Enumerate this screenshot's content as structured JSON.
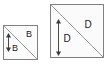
{
  "figure": {
    "background_color": "#ffffff",
    "shapes": [
      {
        "id": "small-square",
        "name": "small-square",
        "side_label": "B",
        "x": 3,
        "y": 25,
        "size": 34,
        "fill": "#fbfbfb",
        "stroke": "#808080",
        "diagonal": "top-left-to-bottom-right",
        "diagonal_color": "#9a9a9a",
        "arrow": {
          "name": "vertical-dimension-arrow-small",
          "orientation": "vertical",
          "double_headed": true,
          "x": 8,
          "y_top": 34,
          "y_bottom": 51,
          "color": "#3a3a3a"
        },
        "labels": [
          {
            "text": "B",
            "x": 29,
            "y": 37,
            "size": "small",
            "position": "upper-right"
          },
          {
            "text": "B",
            "x": 15,
            "y": 51,
            "size": "small",
            "position": "lower-left"
          }
        ]
      },
      {
        "id": "large-square",
        "name": "large-square",
        "side_label": "D",
        "x": 50,
        "y": 4,
        "size": 53,
        "fill": "#fbfbfb",
        "stroke": "#808080",
        "diagonal": "top-left-to-bottom-right",
        "diagonal_color": "#9a9a9a",
        "arrow": {
          "name": "vertical-dimension-arrow-large",
          "orientation": "vertical",
          "double_headed": true,
          "x": 58,
          "y_top": 20,
          "y_bottom": 55,
          "color": "#3a3a3a"
        },
        "labels": [
          {
            "text": "D",
            "x": 88,
            "y": 28,
            "size": "large",
            "position": "upper-right"
          },
          {
            "text": "D",
            "x": 67,
            "y": 42,
            "size": "large",
            "position": "lower-left"
          }
        ]
      }
    ]
  }
}
